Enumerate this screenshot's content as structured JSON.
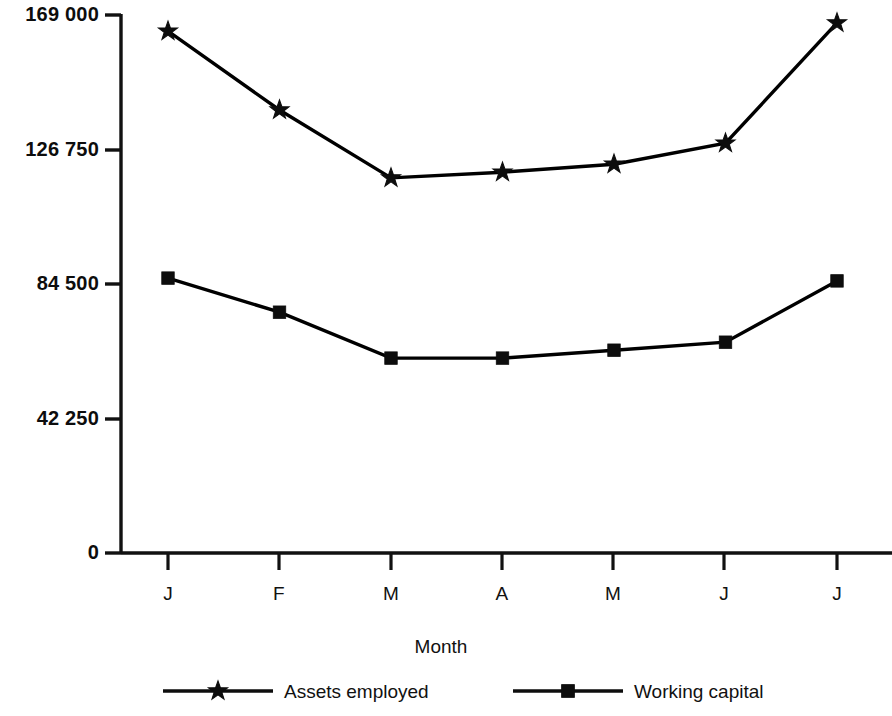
{
  "chart_data": {
    "type": "line",
    "title": "",
    "subtitle": "",
    "xlabel": "Month",
    "ylabel": "",
    "categories": [
      "J",
      "F",
      "M",
      "A",
      "M",
      "J",
      "J"
    ],
    "x_tick_labels": [
      "J",
      "F",
      "M",
      "A",
      "M",
      "J",
      "J"
    ],
    "y_tick_labels": [
      "169 000",
      "126 750",
      "84 500",
      "42 250",
      "0"
    ],
    "y_tick_values": [
      169000,
      126750,
      84500,
      42250,
      0
    ],
    "ylim": [
      0,
      169000
    ],
    "grid": false,
    "legend_position": "bottom",
    "series": [
      {
        "name": "Assets employed",
        "marker": "star",
        "color": "#000000",
        "values": [
          163600,
          138900,
          117600,
          119400,
          121900,
          128500,
          166200
        ]
      },
      {
        "name": "Working capital",
        "marker": "square",
        "color": "#000000",
        "values": [
          86200,
          75500,
          61100,
          61100,
          63600,
          66100,
          85300
        ]
      }
    ]
  },
  "legend": {
    "entries": [
      {
        "label": "Assets employed",
        "marker": "star-marker-icon"
      },
      {
        "label": "Working capital",
        "marker": "square-marker-icon"
      }
    ]
  },
  "axes": {
    "x_title": "Month"
  },
  "colors": {
    "ink": "#111111",
    "background": "#ffffff"
  }
}
